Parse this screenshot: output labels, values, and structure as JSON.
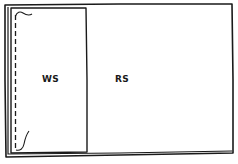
{
  "diagram": {
    "labels": {
      "left_region": "WS",
      "right_region": "RS"
    },
    "colors": {
      "stroke": "#1a1a1a",
      "background": "#ffffff"
    }
  }
}
